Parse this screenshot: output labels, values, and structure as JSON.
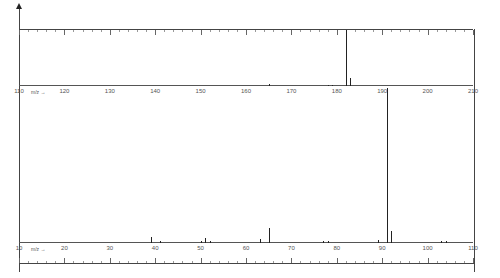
{
  "chart_data": [
    {
      "type": "bar",
      "title": "",
      "xlabel": "m/z",
      "ylabel": "",
      "xlim": [
        110,
        210
      ],
      "xticks": [
        110,
        120,
        130,
        140,
        150,
        160,
        170,
        180,
        190,
        200,
        210
      ],
      "peaks": [
        {
          "mz": 165,
          "intensity": 3
        },
        {
          "mz": 178,
          "intensity": 2
        },
        {
          "mz": 179,
          "intensity": 2
        },
        {
          "mz": 182,
          "intensity": 100
        },
        {
          "mz": 183,
          "intensity": 15
        }
      ]
    },
    {
      "type": "bar",
      "title": "",
      "xlabel": "m/z",
      "ylabel": "",
      "xlim": [
        10,
        110
      ],
      "xticks": [
        10,
        20,
        30,
        40,
        50,
        60,
        70,
        80,
        90,
        100,
        110
      ],
      "peaks": [
        {
          "mz": 39,
          "intensity": 4
        },
        {
          "mz": 41,
          "intensity": 1
        },
        {
          "mz": 50,
          "intensity": 1.5
        },
        {
          "mz": 51,
          "intensity": 3
        },
        {
          "mz": 52,
          "intensity": 1
        },
        {
          "mz": 63,
          "intensity": 2.5
        },
        {
          "mz": 65,
          "intensity": 10
        },
        {
          "mz": 77,
          "intensity": 1.5
        },
        {
          "mz": 78,
          "intensity": 1
        },
        {
          "mz": 89,
          "intensity": 2
        },
        {
          "mz": 91,
          "intensity": 100
        },
        {
          "mz": 92,
          "intensity": 8
        },
        {
          "mz": 103,
          "intensity": 1
        },
        {
          "mz": 104,
          "intensity": 1.5
        }
      ]
    }
  ],
  "labels": {
    "axis_unit": "m/z →",
    "top_ticks": [
      "110",
      "120",
      "130",
      "140",
      "150",
      "160",
      "170",
      "180",
      "190",
      "200",
      "210"
    ],
    "bottom_ticks": [
      "10",
      "20",
      "30",
      "40",
      "50",
      "60",
      "70",
      "80",
      "90",
      "100",
      "110"
    ]
  }
}
